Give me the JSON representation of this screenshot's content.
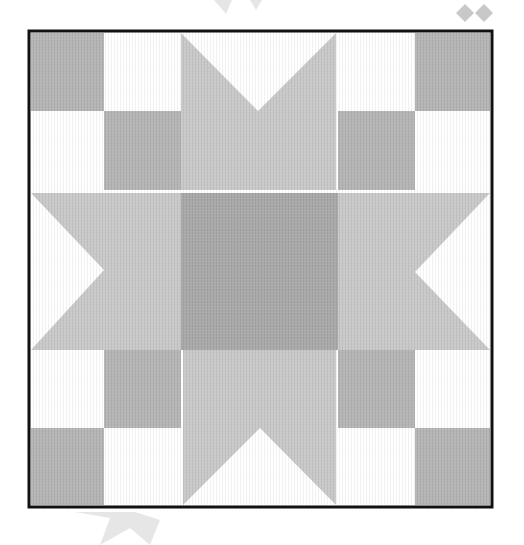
{
  "image": {
    "title": "Sawtooth Star quilt block",
    "width": 524,
    "height": 545
  },
  "colors": {
    "background": "#ffffff",
    "frame": "#111111",
    "light_gray": "#c9c9c9",
    "medium_gray": "#b5b5b5",
    "dark_gray": "#a9a9a9",
    "white": "#ffffff",
    "faded_decor": "#e6e6e6",
    "faded_decor_dark": "#c8c8c8"
  },
  "block": {
    "frame": {
      "x": 29,
      "y": 31,
      "w": 463,
      "h": 476,
      "stroke": 3
    },
    "columns": [
      31,
      104,
      181,
      338,
      415,
      490
    ],
    "rows": [
      33,
      111,
      190,
      350,
      428,
      505
    ],
    "pieces": {
      "corner_checkers": [
        {
          "name": "top-left",
          "squares": [
            {
              "x": 31,
              "y": 33,
              "w": 73,
              "h": 78,
              "fill": "medium_gray"
            },
            {
              "x": 104,
              "y": 33,
              "w": 77,
              "h": 78,
              "fill": "white"
            },
            {
              "x": 31,
              "y": 111,
              "w": 73,
              "h": 79,
              "fill": "white"
            },
            {
              "x": 104,
              "y": 111,
              "w": 77,
              "h": 79,
              "fill": "medium_gray"
            }
          ]
        },
        {
          "name": "top-right",
          "squares": [
            {
              "x": 338,
              "y": 33,
              "w": 77,
              "h": 78,
              "fill": "white"
            },
            {
              "x": 415,
              "y": 33,
              "w": 75,
              "h": 78,
              "fill": "medium_gray"
            },
            {
              "x": 338,
              "y": 111,
              "w": 77,
              "h": 79,
              "fill": "medium_gray"
            },
            {
              "x": 415,
              "y": 111,
              "w": 75,
              "h": 79,
              "fill": "white"
            }
          ]
        },
        {
          "name": "bottom-left",
          "squares": [
            {
              "x": 31,
              "y": 350,
              "w": 73,
              "h": 78,
              "fill": "white"
            },
            {
              "x": 104,
              "y": 350,
              "w": 77,
              "h": 78,
              "fill": "medium_gray"
            },
            {
              "x": 31,
              "y": 428,
              "w": 73,
              "h": 77,
              "fill": "medium_gray"
            },
            {
              "x": 104,
              "y": 428,
              "w": 77,
              "h": 77,
              "fill": "white"
            }
          ]
        },
        {
          "name": "bottom-right",
          "squares": [
            {
              "x": 338,
              "y": 350,
              "w": 77,
              "h": 78,
              "fill": "medium_gray"
            },
            {
              "x": 415,
              "y": 350,
              "w": 75,
              "h": 78,
              "fill": "white"
            },
            {
              "x": 338,
              "y": 428,
              "w": 77,
              "h": 77,
              "fill": "white"
            },
            {
              "x": 415,
              "y": 428,
              "w": 75,
              "h": 77,
              "fill": "medium_gray"
            }
          ]
        }
      ],
      "star_points": [
        {
          "name": "top",
          "points": "181,33 258,111 336,33 336,190 181,190"
        },
        {
          "name": "bottom",
          "points": "183,505 260,428 336,505 336,350 183,350"
        },
        {
          "name": "left",
          "points": "31,193 104,270 31,350 181,350 181,193"
        },
        {
          "name": "right",
          "points": "490,193 415,272 490,350 338,350 338,193"
        }
      ],
      "center": {
        "x": 181,
        "y": 193,
        "w": 157,
        "h": 157,
        "fill": "dark_gray"
      }
    }
  },
  "decorations": [
    {
      "name": "diamond-left",
      "points": "465,4 474,13 465,22 456,13"
    },
    {
      "name": "diamond-right",
      "points": "484,4 493,13 484,22 475,13"
    },
    {
      "name": "faded-star-top",
      "points": "214,0 226,14 232,0 250,0 256,10 262,0"
    },
    {
      "name": "faded-star-bottom",
      "points": "75,512 110,518 100,545 130,528 150,545 160,520 135,512"
    }
  ]
}
